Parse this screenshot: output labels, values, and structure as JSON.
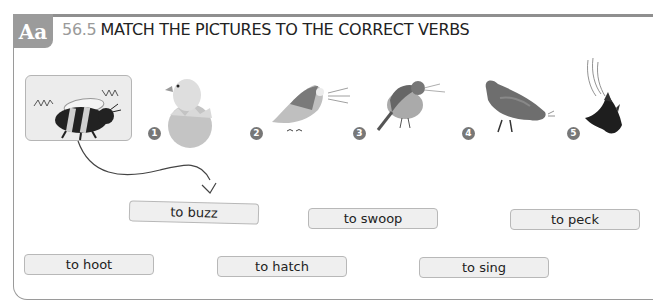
{
  "exercise": {
    "icon_label": "Aa",
    "number": "56.5",
    "title": "MATCH THE PICTURES TO THE CORRECT VERBS"
  },
  "pictures": [
    {
      "number": "",
      "subject": "bee",
      "example": true
    },
    {
      "number": "1",
      "subject": "chick-hatching-from-egg"
    },
    {
      "number": "2",
      "subject": "owl-hooting"
    },
    {
      "number": "3",
      "subject": "bird-singing"
    },
    {
      "number": "4",
      "subject": "hen-pecking"
    },
    {
      "number": "5",
      "subject": "bird-swooping"
    }
  ],
  "verbs": [
    {
      "label": "to buzz",
      "example": true
    },
    {
      "label": "to swoop"
    },
    {
      "label": "to peck"
    },
    {
      "label": "to hoot"
    },
    {
      "label": "to hatch"
    },
    {
      "label": "to sing"
    }
  ]
}
